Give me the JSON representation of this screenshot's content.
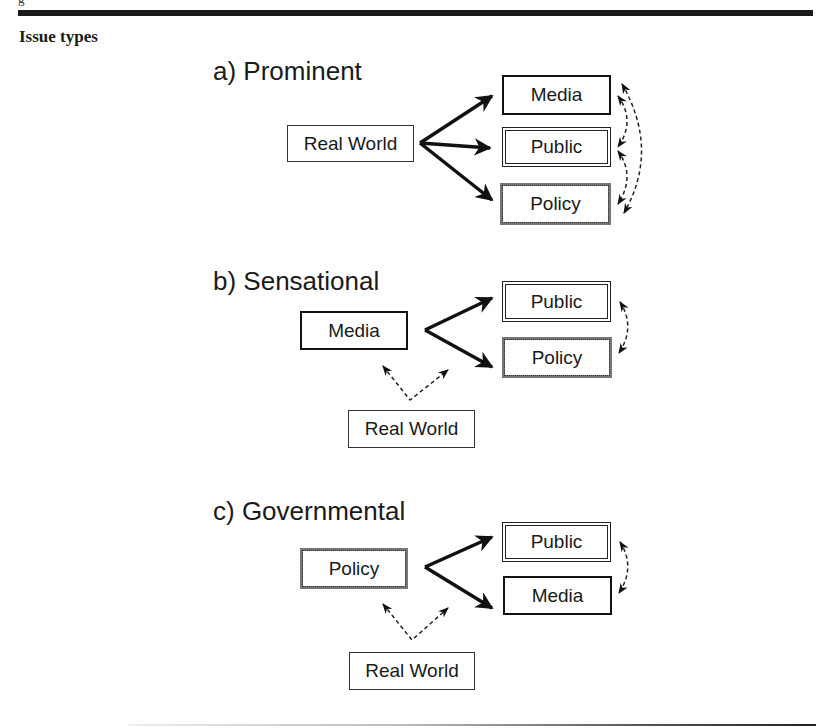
{
  "header": {
    "clipped_text": "g",
    "section_title": "Issue types"
  },
  "diagrams": [
    {
      "heading": "a)  Prominent",
      "source": "Real World",
      "targets": [
        "Media",
        "Public",
        "Policy"
      ],
      "feedback": [
        "Media ↔ Public",
        "Public ↔ Policy",
        "Media ↔ Policy"
      ]
    },
    {
      "heading": "b)  Sensational",
      "source": "Media",
      "targets": [
        "Public",
        "Policy"
      ],
      "trigger": "Real World",
      "feedback": [
        "Public ↔ Policy"
      ]
    },
    {
      "heading": "c)  Governmental",
      "source": "Policy",
      "targets": [
        "Public",
        "Media"
      ],
      "trigger": "Real World",
      "feedback": [
        "Public ↔ Media"
      ]
    }
  ],
  "legend_styles": {
    "Media": "solid-border",
    "Public": "double-border",
    "Policy": "hatched-border",
    "Real World": "plain-border"
  }
}
